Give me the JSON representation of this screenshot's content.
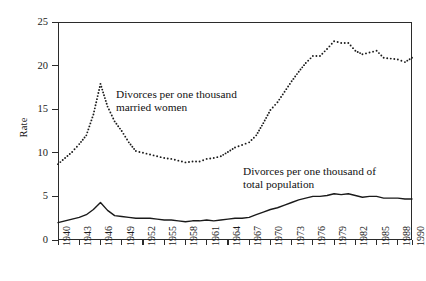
{
  "chart_data": {
    "type": "line",
    "title": "",
    "xlabel": "",
    "ylabel": "Rate",
    "xlim": [
      1940,
      1990
    ],
    "ylim": [
      0,
      25
    ],
    "grid": false,
    "legend": "inline-annotations",
    "y_ticks": [
      0,
      5,
      10,
      15,
      20,
      25
    ],
    "x_ticks": [
      1940,
      1943,
      1946,
      1949,
      1952,
      1955,
      1958,
      1961,
      1964,
      1967,
      1970,
      1973,
      1976,
      1979,
      1982,
      1985,
      1988,
      1990
    ],
    "x": [
      1940,
      1941,
      1942,
      1943,
      1944,
      1945,
      1946,
      1947,
      1948,
      1949,
      1950,
      1951,
      1952,
      1953,
      1954,
      1955,
      1956,
      1957,
      1958,
      1959,
      1960,
      1961,
      1962,
      1963,
      1964,
      1965,
      1966,
      1967,
      1968,
      1969,
      1970,
      1971,
      1972,
      1973,
      1974,
      1975,
      1976,
      1977,
      1978,
      1979,
      1980,
      1981,
      1982,
      1983,
      1984,
      1985,
      1986,
      1987,
      1988,
      1989,
      1990
    ],
    "series": [
      {
        "name": "Divorces per one thousand married women",
        "style": "dotted",
        "annotation": "Divorces per one thousand\nmarried women",
        "values": [
          8.7,
          9.4,
          10.1,
          11.0,
          12.0,
          14.4,
          17.9,
          15.3,
          13.6,
          12.5,
          11.2,
          10.2,
          10.0,
          9.8,
          9.6,
          9.4,
          9.3,
          9.1,
          8.9,
          9.0,
          9.0,
          9.3,
          9.4,
          9.6,
          10.1,
          10.6,
          10.9,
          11.2,
          12.0,
          13.4,
          14.9,
          15.8,
          17.0,
          18.2,
          19.3,
          20.3,
          21.1,
          21.1,
          21.9,
          22.8,
          22.6,
          22.6,
          21.7,
          21.3,
          21.5,
          21.7,
          20.9,
          20.8,
          20.7,
          20.4,
          20.9
        ]
      },
      {
        "name": "Divorces per one thousand of total population",
        "style": "solid",
        "annotation": "Divorces per one thousand of\ntotal population",
        "values": [
          2.0,
          2.2,
          2.4,
          2.6,
          2.9,
          3.5,
          4.3,
          3.4,
          2.8,
          2.7,
          2.6,
          2.5,
          2.5,
          2.5,
          2.4,
          2.3,
          2.3,
          2.2,
          2.1,
          2.2,
          2.2,
          2.3,
          2.2,
          2.3,
          2.4,
          2.5,
          2.5,
          2.6,
          2.9,
          3.2,
          3.5,
          3.7,
          4.0,
          4.3,
          4.6,
          4.8,
          5.0,
          5.0,
          5.1,
          5.3,
          5.2,
          5.3,
          5.1,
          4.9,
          5.0,
          5.0,
          4.8,
          4.8,
          4.8,
          4.7,
          4.7
        ]
      }
    ]
  },
  "axes": {
    "y_title": "Rate",
    "y_tick_labels": [
      "0",
      "5",
      "10",
      "15",
      "20",
      "25"
    ],
    "x_tick_labels": [
      "1940",
      "1943",
      "1946",
      "1949",
      "1952",
      "1955",
      "1958",
      "1961",
      "1964",
      "1967",
      "1970",
      "1973",
      "1976",
      "1979",
      "1982",
      "1985",
      "1988",
      "1990"
    ]
  },
  "annotations": {
    "married_women": "Divorces per one thousand\nmarried women",
    "total_population": "Divorces per one thousand of\ntotal population"
  },
  "colors": {
    "axis": "#2b2b2b",
    "series_dotted": "#1a1a1a",
    "series_solid": "#1a1a1a",
    "background": "#ffffff"
  }
}
